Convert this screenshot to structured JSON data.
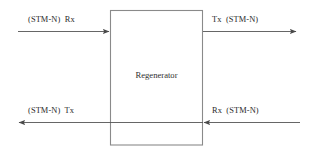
{
  "diagram": {
    "type": "block-diagram",
    "title_element": "Regenerator",
    "node": {
      "label": "Regenerator",
      "shape": "rectangle",
      "border_color": "#8a8a8a",
      "fill_color": "#ffffff"
    },
    "line_color": "#555555",
    "text_color": "#2b2b2b",
    "background_color": "#ffffff",
    "signals": [
      {
        "id": "top-left-input",
        "label": "(STM-N)  Rx",
        "direction": "right",
        "position": "top-left",
        "description": "incoming receive signal into regenerator"
      },
      {
        "id": "top-right-output",
        "label": "Tx  (STM-N)",
        "direction": "right",
        "position": "top-right",
        "description": "outgoing transmit signal from regenerator"
      },
      {
        "id": "bottom-left-output",
        "label": "(STM-N)  Tx",
        "direction": "left",
        "position": "bottom-left",
        "description": "outgoing transmit signal from regenerator"
      },
      {
        "id": "bottom-right-input",
        "label": "Rx  (STM-N)",
        "direction": "left",
        "position": "bottom-right",
        "description": "incoming receive signal into regenerator"
      }
    ]
  }
}
